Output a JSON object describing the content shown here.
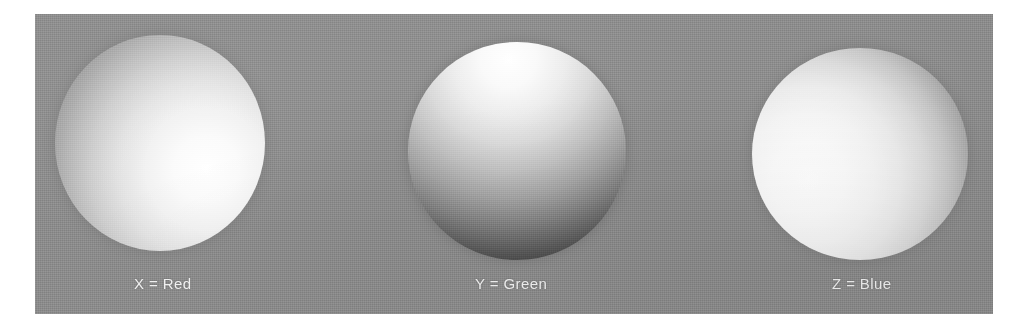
{
  "figure": {
    "kind": "photographic-plate",
    "background_color": "#ffffff",
    "plate_color": "#8d8d8d",
    "caption_color": "#f2f2f2",
    "panels": [
      {
        "id": "x",
        "label": "X = Red",
        "axis": "X",
        "channel": "Red",
        "sphere_name": "sphere-x",
        "highlight_position": "right",
        "highlight_color": "#ffffff",
        "terminator_color": "#767676",
        "shading": "lit from the right; bright limb at right, soft shadow at left edge"
      },
      {
        "id": "y",
        "label": "Y = Green",
        "axis": "Y",
        "channel": "Green",
        "sphere_name": "sphere-y",
        "highlight_position": "top",
        "highlight_color": "#ffffff",
        "terminator_color": "#2c2c2c",
        "shading": "lit from above; bright at top, falling to near-black at the bottom"
      },
      {
        "id": "z",
        "label": "Z = Blue",
        "axis": "Z",
        "channel": "Blue",
        "sphere_name": "sphere-z",
        "highlight_position": "left",
        "highlight_color": "#ffffff",
        "terminator_color": "#6e6e6e",
        "shading": "lit from the left; bright at left, shadowed crescent at right"
      }
    ]
  }
}
